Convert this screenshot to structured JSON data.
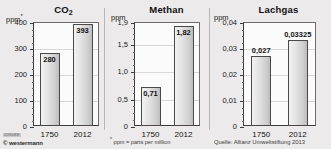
{
  "footnotes": {
    "ppm_note_marker": "*",
    "ppm_note": "ppm = parts per million",
    "source": "Quelle: Allianz Umweltstiftung 2013"
  },
  "imprint": {
    "code": "20948E",
    "brand": "© westermann"
  },
  "colors": {
    "background": "#eceaeb",
    "plot_background": "#fbfbfb",
    "bar_fill_light": "#f2f2f2",
    "bar_fill_dark": "#bdbdbd",
    "bar_border": "#4a4849",
    "axis": "#3d3c3c",
    "gridline": "#d8d6d7"
  },
  "chart_data": [
    {
      "type": "bar",
      "title": "CO2",
      "title_base": "CO",
      "title_sub": "2",
      "ylabel": "ppm",
      "ylabel_marker": "*",
      "xlabel": "",
      "categories": [
        "1750",
        "2012"
      ],
      "values": [
        280,
        393
      ],
      "value_labels": [
        "280",
        "393"
      ],
      "label_position": "inside",
      "ylim": [
        0,
        400
      ],
      "yticks": [
        0,
        100,
        200,
        300,
        400
      ],
      "ytick_labels": [
        "0",
        "100",
        "200",
        "300",
        "400"
      ],
      "minor_ticks_per_interval": 4,
      "grid": true,
      "legend": "none"
    },
    {
      "type": "bar",
      "title": "Methan",
      "ylabel": "ppm",
      "ylabel_marker": "",
      "xlabel": "",
      "categories": [
        "1750",
        "2012"
      ],
      "values": [
        0.71,
        1.82
      ],
      "value_labels": [
        "0,71",
        "1,82"
      ],
      "label_position": "inside",
      "ylim": [
        0,
        1.9
      ],
      "yticks": [
        0,
        0.5,
        1.0,
        1.5,
        1.9
      ],
      "ytick_labels": [
        "0",
        "0,5",
        "1,0",
        "1,5",
        "1,9"
      ],
      "minor_ticks_per_interval": 4,
      "grid": true,
      "legend": "none"
    },
    {
      "type": "bar",
      "title": "Lachgas",
      "ylabel": "ppm",
      "ylabel_marker": "",
      "xlabel": "",
      "categories": [
        "1750",
        "2012"
      ],
      "values": [
        0.027,
        0.03325
      ],
      "value_labels": [
        "0,027",
        "0,03325"
      ],
      "label_position": "outside",
      "ylim": [
        0,
        0.04
      ],
      "yticks": [
        0,
        0.01,
        0.02,
        0.03,
        0.04
      ],
      "ytick_labels": [
        "0",
        "0,01",
        "0,02",
        "0,03",
        "0,04"
      ],
      "minor_ticks_per_interval": 4,
      "grid": true,
      "legend": "none"
    }
  ]
}
